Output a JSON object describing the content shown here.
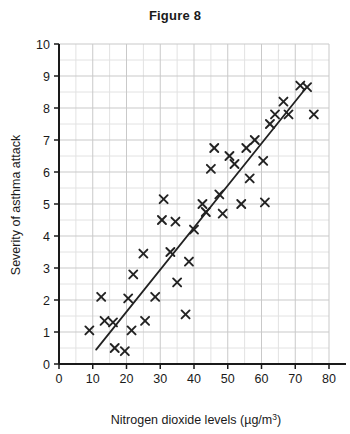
{
  "chart_data": {
    "type": "scatter",
    "title": "Figure 8",
    "xlabel_prefix": "Nitrogen dioxide levels (µg/m",
    "xlabel_sup": "3",
    "xlabel_suffix": ")",
    "xlabel": "Nitrogen dioxide levels (µg/m³)",
    "ylabel": "Severity of asthma attack",
    "xlim": [
      0,
      80
    ],
    "ylim": [
      0,
      10
    ],
    "xticks": [
      0,
      10,
      20,
      30,
      40,
      50,
      60,
      70,
      80
    ],
    "yticks": [
      0,
      1,
      2,
      3,
      4,
      5,
      6,
      7,
      8,
      9,
      10
    ],
    "grid": true,
    "grid_minor": true,
    "grid_color": "#c9c9c9",
    "marker": "x",
    "marker_color": "#222222",
    "legend": null,
    "trend_line": {
      "label": "line of best fit",
      "x": [
        11,
        73
      ],
      "y": [
        0.45,
        8.6
      ],
      "color": "#222222"
    },
    "points": [
      [
        9.0,
        1.05
      ],
      [
        12.5,
        2.1
      ],
      [
        13.5,
        1.35
      ],
      [
        16.0,
        1.3
      ],
      [
        16.5,
        0.5
      ],
      [
        19.5,
        0.4
      ],
      [
        20.5,
        2.05
      ],
      [
        21.5,
        1.05
      ],
      [
        22.0,
        2.8
      ],
      [
        25.5,
        1.35
      ],
      [
        25.0,
        3.45
      ],
      [
        28.5,
        2.1
      ],
      [
        30.5,
        4.5
      ],
      [
        31.0,
        5.15
      ],
      [
        33.0,
        3.5
      ],
      [
        34.5,
        4.45
      ],
      [
        35.0,
        2.55
      ],
      [
        37.5,
        1.55
      ],
      [
        38.5,
        3.2
      ],
      [
        40.0,
        4.2
      ],
      [
        42.5,
        5.0
      ],
      [
        43.5,
        4.75
      ],
      [
        45.0,
        6.1
      ],
      [
        46.0,
        6.75
      ],
      [
        47.5,
        5.3
      ],
      [
        48.5,
        4.7
      ],
      [
        50.5,
        6.5
      ],
      [
        52.0,
        6.25
      ],
      [
        54.0,
        5.0
      ],
      [
        55.5,
        6.75
      ],
      [
        56.5,
        5.8
      ],
      [
        58.0,
        7.0
      ],
      [
        60.5,
        6.35
      ],
      [
        61.0,
        5.05
      ],
      [
        62.5,
        7.5
      ],
      [
        64.0,
        7.8
      ],
      [
        66.5,
        8.2
      ],
      [
        68.0,
        7.8
      ],
      [
        71.5,
        8.7
      ],
      [
        73.5,
        8.65
      ],
      [
        75.5,
        7.8
      ]
    ]
  },
  "figure": {
    "title": "Figure 8"
  }
}
